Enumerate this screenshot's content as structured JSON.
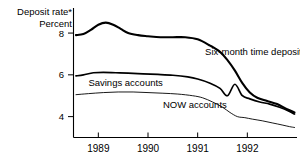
{
  "chart_data": {
    "type": "line",
    "title": "Deposit rate*",
    "subtitle": "Percent",
    "ylabel": "Percent",
    "xlabel": "",
    "ylim": [
      3.0,
      9.2
    ],
    "xlim": [
      1988.5,
      1993.0
    ],
    "grid": false,
    "legend_position": "inline-labels",
    "ytick_labels": [
      "8",
      "6",
      "4"
    ],
    "ytick_values": [
      8,
      6,
      4
    ],
    "xtick_labels": [
      "1989",
      "1990",
      "1991",
      "1992"
    ],
    "xtick_values": [
      1989,
      1990,
      1991,
      1992
    ],
    "footnote_marker": "*",
    "series": [
      {
        "name": "Six-month time deposits",
        "label": "Six-month time deposits",
        "weight": "thick",
        "x": [
          1988.55,
          1988.7,
          1988.85,
          1989.0,
          1989.15,
          1989.3,
          1989.45,
          1989.6,
          1989.8,
          1990.0,
          1990.25,
          1990.5,
          1990.75,
          1991.0,
          1991.25,
          1991.45,
          1991.6,
          1991.75,
          1991.9,
          1992.05,
          1992.2,
          1992.4,
          1992.6,
          1992.8,
          1992.95
        ],
        "values": [
          7.9,
          7.95,
          8.15,
          8.4,
          8.5,
          8.4,
          8.2,
          8.0,
          7.9,
          7.85,
          7.8,
          7.8,
          7.8,
          7.7,
          7.4,
          7.1,
          6.7,
          6.2,
          5.6,
          5.15,
          4.9,
          4.75,
          4.6,
          4.35,
          4.2
        ]
      },
      {
        "name": "Savings accounts",
        "label": "Savings accounts",
        "weight": "med",
        "x": [
          1988.55,
          1988.7,
          1988.9,
          1989.1,
          1989.35,
          1989.6,
          1989.9,
          1990.2,
          1990.5,
          1990.8,
          1991.0,
          1991.25,
          1991.45,
          1991.6,
          1991.75,
          1991.9,
          1992.05,
          1992.25,
          1992.45,
          1992.65,
          1992.85,
          1992.95
        ],
        "values": [
          5.95,
          6.0,
          6.1,
          6.12,
          6.1,
          6.08,
          6.05,
          6.02,
          5.98,
          5.9,
          5.8,
          5.6,
          5.35,
          5.0,
          5.55,
          5.0,
          4.85,
          4.7,
          4.6,
          4.45,
          4.25,
          4.12
        ]
      },
      {
        "name": "NOW accounts",
        "label": "NOW accounts",
        "weight": "thin",
        "x": [
          1988.55,
          1988.8,
          1989.1,
          1989.4,
          1989.7,
          1990.0,
          1990.3,
          1990.6,
          1990.9,
          1991.1,
          1991.3,
          1991.5,
          1991.65,
          1991.8,
          1991.95,
          1992.1,
          1992.3,
          1992.5,
          1992.7,
          1992.85,
          1992.95
        ],
        "values": [
          5.05,
          5.1,
          5.15,
          5.18,
          5.18,
          5.15,
          5.12,
          5.08,
          5.0,
          4.9,
          4.7,
          4.45,
          4.2,
          4.0,
          3.95,
          3.88,
          3.8,
          3.7,
          3.6,
          3.52,
          3.48
        ]
      }
    ],
    "annotations": [
      {
        "text": "Six-month time deposits",
        "x": 1991.15,
        "y": 6.95,
        "anchor": "start"
      },
      {
        "text": "Savings accounts",
        "x": 1988.8,
        "y": 5.45,
        "anchor": "start"
      },
      {
        "text": "NOW accounts",
        "x": 1990.3,
        "y": 4.42,
        "anchor": "start"
      }
    ],
    "colors": {
      "line": "#000000",
      "axis": "#000000",
      "background": "#ffffff"
    }
  }
}
